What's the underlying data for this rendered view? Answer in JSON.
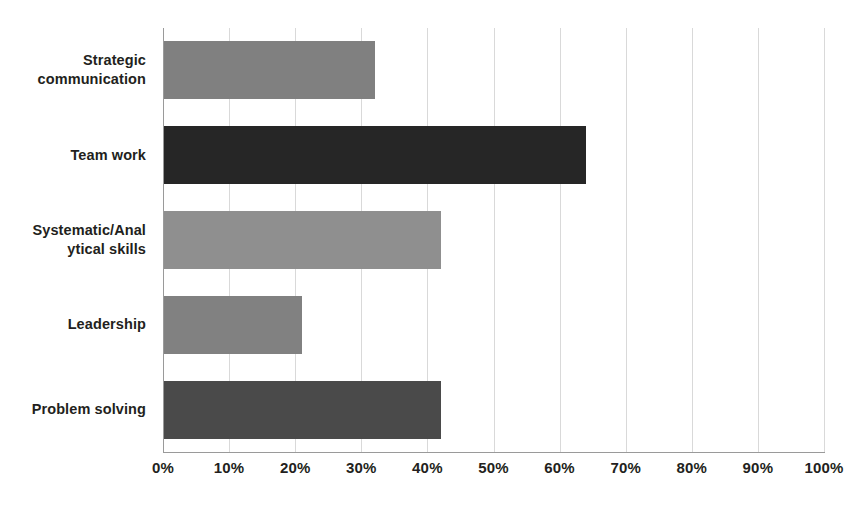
{
  "chart_data": {
    "type": "bar",
    "orientation": "horizontal",
    "title": "",
    "subtitle": "",
    "xlabel": "",
    "ylabel": "",
    "xlim": [
      0,
      100
    ],
    "grid": true,
    "legend": false,
    "legend_position": "none",
    "categories": [
      "Strategic\ncommunication",
      "Team work",
      "Systematic/Anal\nytical skills",
      "Leadership",
      "Problem solving"
    ],
    "values": [
      32,
      64,
      42,
      21,
      42
    ],
    "value_suffix": "%",
    "bar_colors": [
      "#808080",
      "#262626",
      "#8f8f8f",
      "#818181",
      "#4a4a4a"
    ],
    "x_ticks": [
      0,
      10,
      20,
      30,
      40,
      50,
      60,
      70,
      80,
      90,
      100
    ],
    "x_tick_labels": [
      "0%",
      "10%",
      "20%",
      "30%",
      "40%",
      "50%",
      "60%",
      "70%",
      "80%",
      "90%",
      "100%"
    ],
    "axis_color": "#9a9a9a",
    "grid_color": "#d9d9d9",
    "text_color": "#231f20",
    "background": "#ffffff"
  }
}
